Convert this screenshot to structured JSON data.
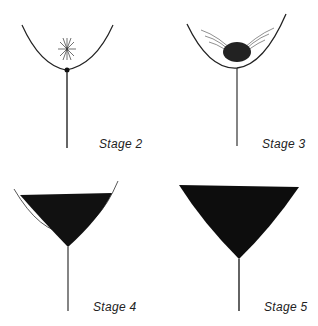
{
  "figure": {
    "panels": [
      {
        "id": "stage-2",
        "label": "Stage 2"
      },
      {
        "id": "stage-3",
        "label": "Stage 3"
      },
      {
        "id": "stage-4",
        "label": "Stage 4"
      },
      {
        "id": "stage-5",
        "label": "Stage 5"
      }
    ],
    "colors": {
      "ink": "#111111",
      "background": "#ffffff"
    }
  }
}
